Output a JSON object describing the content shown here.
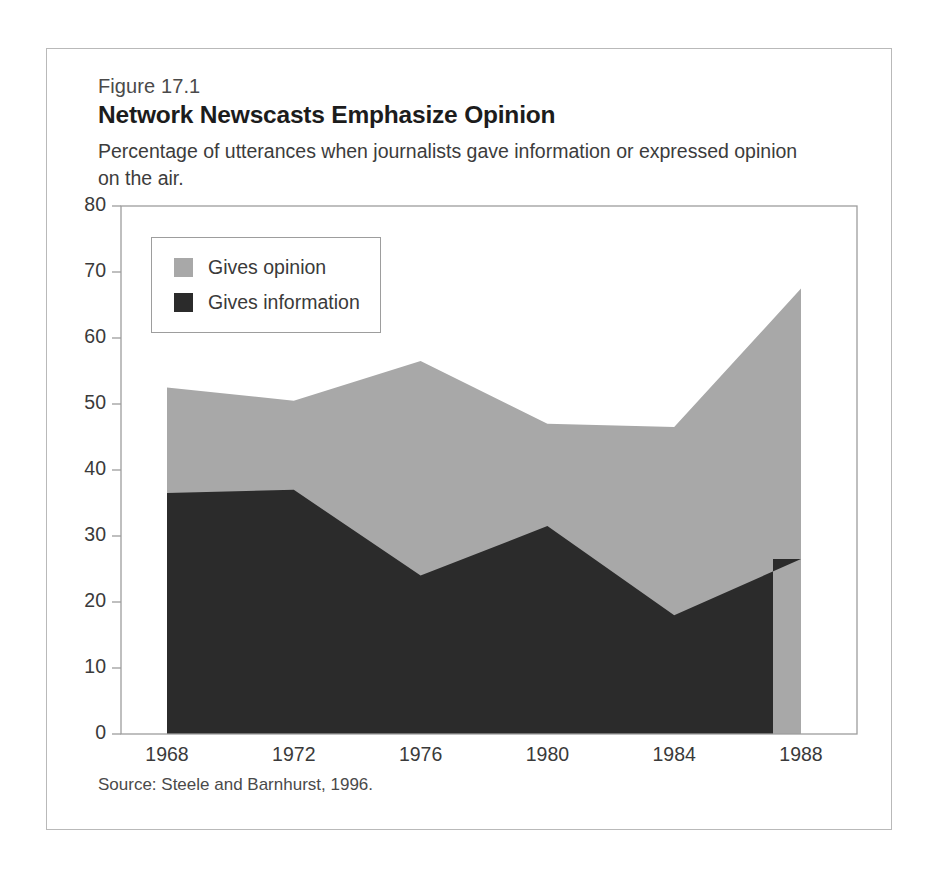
{
  "figure": {
    "number": "Figure 17.1",
    "title": "Network Newscasts Emphasize Opinion",
    "subtitle": "Percentage of utterances when journalists gave information or expressed opinion on the air.",
    "source": "Source: Steele and Barnhurst, 1996."
  },
  "legend": {
    "items": [
      {
        "label": "Gives opinion",
        "color": "#a8a8a8"
      },
      {
        "label": "Gives information",
        "color": "#2b2b2b"
      }
    ]
  },
  "axes": {
    "y_ticks": [
      "80",
      "70",
      "60",
      "50",
      "40",
      "30",
      "20",
      "10",
      "0"
    ],
    "x_ticks": [
      "1968",
      "1972",
      "1976",
      "1980",
      "1984",
      "1988"
    ]
  },
  "chart_data": {
    "type": "area",
    "stacked": true,
    "title": "Network Newscasts Emphasize Opinion",
    "subtitle": "Percentage of utterances when journalists gave information or expressed opinion on the air.",
    "xlabel": "",
    "ylabel": "",
    "xlim": [
      1967,
      1989
    ],
    "ylim": [
      0,
      80
    ],
    "grid": false,
    "legend_position": "upper-left-inside",
    "source": "Source: Steele and Barnhurst, 1996.",
    "x": [
      1968,
      1972,
      1976,
      1980,
      1984,
      1988
    ],
    "series": [
      {
        "name": "Gives information",
        "color": "#2b2b2b",
        "values": [
          36.5,
          37,
          24,
          31.5,
          18,
          26.5
        ]
      },
      {
        "name": "Gives opinion",
        "color": "#a8a8a8",
        "values": [
          16,
          13.5,
          32.5,
          15.5,
          28.5,
          41
        ]
      }
    ],
    "cumulative_top": [
      52.5,
      50.5,
      56.5,
      47,
      46.5,
      67.5
    ]
  }
}
